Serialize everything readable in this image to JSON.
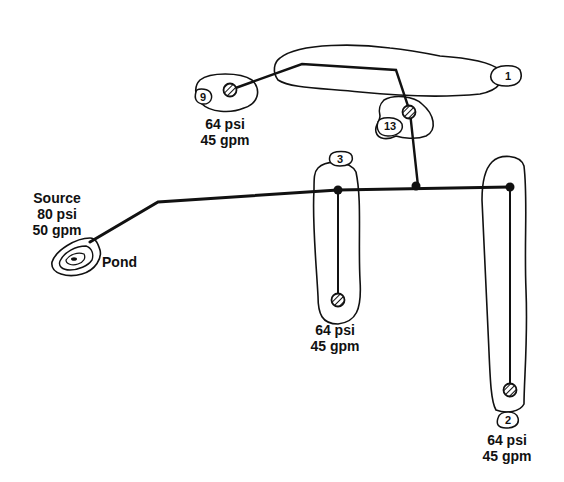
{
  "diagram": {
    "type": "irrigation-pipe-network",
    "source": {
      "title": "Source",
      "pressure": "80 psi",
      "flow": "50 gpm",
      "name": "Pond"
    },
    "holes": [
      {
        "id": "1",
        "label": "1"
      },
      {
        "id": "9",
        "label": "9",
        "pressure": "64 psi",
        "flow": "45 gpm"
      },
      {
        "id": "13",
        "label": "13"
      },
      {
        "id": "3",
        "label": "3",
        "pressure": "64 psi",
        "flow": "45 gpm"
      },
      {
        "id": "2",
        "label": "2",
        "pressure": "64 psi",
        "flow": "45 gpm"
      }
    ],
    "colors": {
      "line": "#111111",
      "background": "#ffffff"
    }
  }
}
